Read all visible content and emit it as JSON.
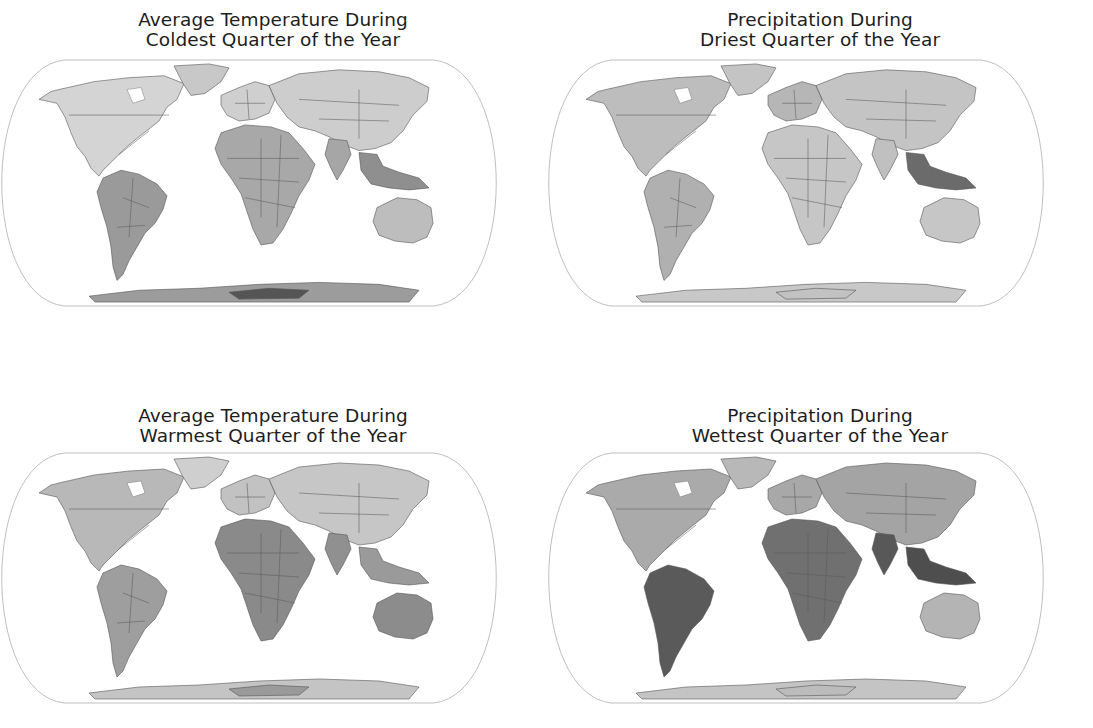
{
  "figure": {
    "projection": "Robinson-like (flat-polar pseudocylindrical)",
    "color_scheme": "grayscale",
    "background": "#ffffff",
    "outline_color": "#b8b8b8"
  },
  "panels": [
    {
      "id": "temp-coldest",
      "title_line1": "Average Temperature During",
      "title_line2": "Coldest Quarter of the Year",
      "variable": "temperature",
      "season": "coldest quarter",
      "shading": {
        "north_america": "#d4d4d4",
        "greenland": "#c8c8c8",
        "south_america": "#9a9a9a",
        "europe": "#cfcfcf",
        "africa": "#a8a8a8",
        "asia": "#cdcdcd",
        "india": "#a6a6a6",
        "se_asia": "#8f8f8f",
        "australia": "#bdbdbd",
        "antarctica": "#9c9c9c",
        "antarctica_core": "#555555"
      }
    },
    {
      "id": "precip-driest",
      "title_line1": "Precipitation During",
      "title_line2": "Driest Quarter of the Year",
      "variable": "precipitation",
      "season": "driest quarter",
      "shading": {
        "north_america": "#bdbdbd",
        "greenland": "#c4c4c4",
        "south_america": "#b0b0b0",
        "europe": "#b6b6b6",
        "africa": "#c6c6c6",
        "asia": "#c4c4c4",
        "india": "#c0c0c0",
        "se_asia": "#6b6b6b",
        "australia": "#c6c6c6",
        "antarctica": "#c8c8c8",
        "antarctica_core": "#c2c2c2"
      }
    },
    {
      "id": "temp-warmest",
      "title_line1": "Average Temperature During",
      "title_line2": "Warmest Quarter of the Year",
      "variable": "temperature",
      "season": "warmest quarter",
      "shading": {
        "north_america": "#b8b8b8",
        "greenland": "#cfcfcf",
        "south_america": "#9e9e9e",
        "europe": "#c2c2c2",
        "africa": "#8a8a8a",
        "asia": "#c6c6c6",
        "india": "#909090",
        "se_asia": "#9a9a9a",
        "australia": "#8c8c8c",
        "antarctica": "#c4c4c4",
        "antarctica_core": "#9a9a9a"
      }
    },
    {
      "id": "precip-wettest",
      "title_line1": "Precipitation During",
      "title_line2": "Wettest Quarter of the Year",
      "variable": "precipitation",
      "season": "wettest quarter",
      "shading": {
        "north_america": "#aaaaaa",
        "greenland": "#b8b8b8",
        "south_america": "#5a5a5a",
        "europe": "#a8a8a8",
        "africa": "#707070",
        "asia": "#a4a4a4",
        "india": "#585858",
        "se_asia": "#4e4e4e",
        "australia": "#b4b4b4",
        "antarctica": "#c4c4c4",
        "antarctica_core": "#bcbcbc"
      }
    }
  ]
}
